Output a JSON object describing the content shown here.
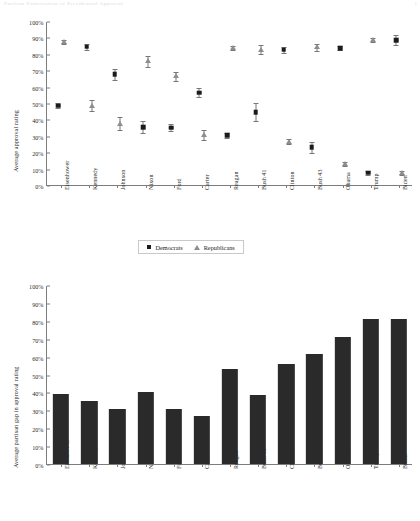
{
  "header": {
    "faint_top_text": "Partisan Polarization of Presidential Approval",
    "faint_corner": "1"
  },
  "chart_data": [
    {
      "type": "scatter",
      "title": "",
      "xlabel": "",
      "ylabel": "Average approval rating",
      "ylim": [
        0,
        100
      ],
      "ytick_labels": [
        "0%",
        "10%",
        "20%",
        "30%",
        "40%",
        "50%",
        "60%",
        "70%",
        "80%",
        "90%",
        "100%"
      ],
      "ytick_values": [
        0,
        10,
        20,
        30,
        40,
        50,
        60,
        70,
        80,
        90,
        100
      ],
      "grid": false,
      "legend_position": "below-center",
      "categories": [
        "Eisenhower",
        "Kennedy",
        "Johnson",
        "Nixon",
        "Ford",
        "Carter",
        "Reagan",
        "Bush 41",
        "Clinton",
        "Bush 43",
        "Obama",
        "Trump",
        "Biden"
      ],
      "series": [
        {
          "name": "Democrats",
          "marker": "square",
          "color": "#1b1b1b",
          "values": [
            49,
            85,
            68,
            36,
            35.5,
            57,
            31,
            45,
            83,
            23.5,
            84,
            8,
            89
          ],
          "errors": [
            1.5,
            1.8,
            3.2,
            3.5,
            2.2,
            2.8,
            1.5,
            5.5,
            1.8,
            3.5,
            1.2,
            1.0,
            3.0
          ]
        },
        {
          "name": "Republicans",
          "marker": "triangle",
          "color": "#8e8e8e",
          "values": [
            88,
            49,
            38,
            76,
            67,
            31,
            84,
            83,
            27,
            84.5,
            13.5,
            89,
            8
          ],
          "errors": [
            1.2,
            3.5,
            3.8,
            3.5,
            2.8,
            3.2,
            1.2,
            2.8,
            1.5,
            2.2,
            1.0,
            1.2,
            1.0
          ]
        }
      ]
    },
    {
      "type": "bar",
      "title": "",
      "xlabel": "",
      "ylabel": "Average partisan gap in approval rating",
      "ylim": [
        0,
        100
      ],
      "ytick_labels": [
        "0%",
        "10%",
        "20%",
        "30%",
        "40%",
        "50%",
        "60%",
        "70%",
        "80%",
        "90%",
        "100%"
      ],
      "ytick_values": [
        0,
        10,
        20,
        30,
        40,
        50,
        60,
        70,
        80,
        90,
        100
      ],
      "grid": false,
      "bar_color": "#2a2a2a",
      "categories": [
        "Eisenhower",
        "Kennedy",
        "Johnson",
        "Nixon",
        "Ford",
        "Carter",
        "Reagan",
        "Bush 41",
        "Clinton",
        "Bush 43",
        "Obama",
        "Trump",
        "Biden"
      ],
      "values": [
        39,
        35,
        30.5,
        40,
        31,
        27,
        53,
        38.5,
        56,
        61.5,
        71,
        81,
        81
      ]
    }
  ],
  "legend": {
    "items": [
      {
        "label": "Democrats",
        "marker": "square-marker-icon"
      },
      {
        "label": "Republicans",
        "marker": "triangle-marker-icon"
      }
    ]
  }
}
